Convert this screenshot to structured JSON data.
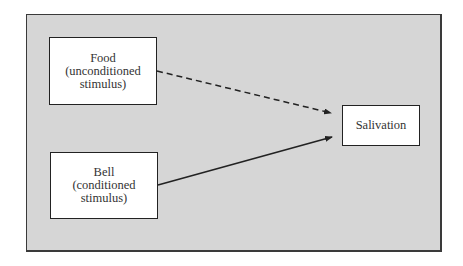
{
  "diagram": {
    "nodes": [
      {
        "id": "food",
        "lines": [
          "Food",
          "(unconditioned",
          "stimulus)"
        ]
      },
      {
        "id": "bell",
        "lines": [
          "Bell",
          "(conditioned",
          "stimulus)"
        ]
      },
      {
        "id": "salivation",
        "lines": [
          "Salivation"
        ]
      }
    ],
    "edges": [
      {
        "from": "food",
        "to": "salivation",
        "style": "dashed"
      },
      {
        "from": "bell",
        "to": "salivation",
        "style": "solid"
      }
    ],
    "colors": {
      "background": "#d6d6d6",
      "box_fill": "#ffffff",
      "stroke": "#222222"
    }
  }
}
